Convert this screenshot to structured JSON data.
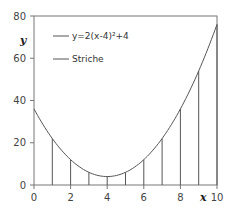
{
  "chart_data": {
    "type": "line",
    "title": "",
    "xlabel": "x",
    "ylabel": "y",
    "xlim": [
      0,
      10
    ],
    "ylim": [
      0,
      80
    ],
    "x_ticks": [
      0,
      2,
      4,
      6,
      8,
      10
    ],
    "y_ticks": [
      0,
      20,
      40,
      60,
      80
    ],
    "grid": false,
    "legend_position": "upper-left-inside",
    "series": [
      {
        "name": "y=2(x-4)²+4",
        "type": "line",
        "function": "2*(x-4)^2+4",
        "x": [
          0,
          1,
          2,
          3,
          4,
          5,
          6,
          7,
          8,
          9,
          10
        ],
        "values": [
          36,
          22,
          12,
          6,
          4,
          6,
          12,
          22,
          36,
          54,
          76
        ]
      },
      {
        "name": "Striche",
        "type": "vertical-lines",
        "x": [
          1,
          2,
          3,
          4,
          5,
          6,
          7,
          8,
          9,
          10
        ],
        "values": [
          22,
          12,
          6,
          4,
          6,
          12,
          22,
          36,
          54,
          76
        ]
      }
    ]
  },
  "axes": {
    "x_label": "x",
    "y_label": "y",
    "x_tick_labels": [
      "0",
      "2",
      "4",
      "6",
      "8",
      "10"
    ],
    "y_tick_labels": [
      "0",
      "20",
      "40",
      "60",
      "80"
    ]
  },
  "legend": {
    "items": [
      {
        "label": "y=2(x-4)²+4"
      },
      {
        "label": "Striche"
      }
    ]
  },
  "colors": {
    "line": "#555555",
    "axis": "#777777",
    "text": "#333333"
  }
}
